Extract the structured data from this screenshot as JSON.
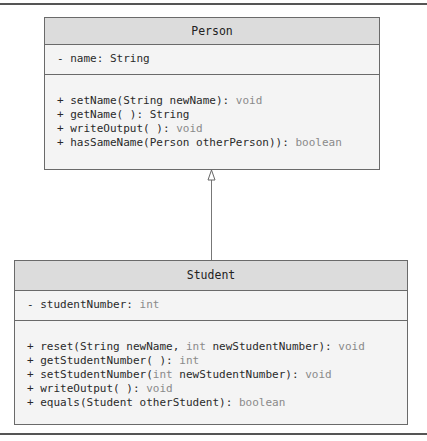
{
  "diagram": {
    "type": "UML class diagram",
    "relationship": "generalization (Student inherits from Person)",
    "classes": [
      {
        "name": "Person",
        "attributes": [
          {
            "text": "- name: String",
            "parts": [
              "- name: ",
              "String"
            ],
            "type_is_keyword": false
          }
        ],
        "methods": [
          {
            "sig": "+ setName(String newName): ",
            "ret": "void"
          },
          {
            "sig": "+ getName( ): String",
            "ret": ""
          },
          {
            "sig": "+ writeOutput( ): ",
            "ret": "void"
          },
          {
            "sig": "+ hasSameName(Person otherPerson)): ",
            "ret": "boolean"
          }
        ]
      },
      {
        "name": "Student",
        "attributes": [
          {
            "sig": "- studentNumber: ",
            "ret": "int"
          }
        ],
        "methods": [
          {
            "pre": "+ reset(String newName, ",
            "kw1": "int",
            "post": " newStudentNumber): ",
            "ret": "void"
          },
          {
            "sig": "+ getStudentNumber( ): ",
            "ret": "int"
          },
          {
            "pre": "+ setStudentNumber(",
            "kw1": "int",
            "post": " newStudentNumber): ",
            "ret": "void"
          },
          {
            "sig": "+ writeOutput( ): ",
            "ret": "void"
          },
          {
            "sig": "+ equals(Student otherStudent): ",
            "ret": "boolean"
          }
        ]
      }
    ]
  }
}
